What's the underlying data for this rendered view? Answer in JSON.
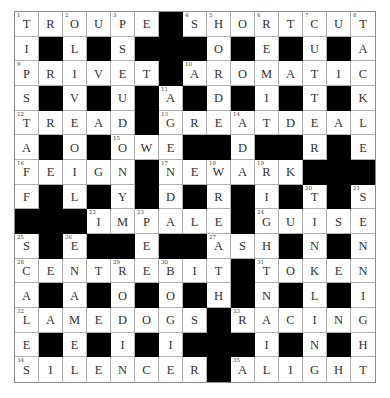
{
  "puzzle": {
    "type": "crossword",
    "rows": 15,
    "cols": 15,
    "colors": {
      "black_square": "#000000",
      "white_square": "#ffffff",
      "grid_line": "#b0b0b0",
      "letter": "#333333"
    },
    "grid": [
      "TROUPE#SHORTCUT",
      "I#L#S###O#E#U#A",
      "PRIVET#AROMATIC",
      "S#V#U#A#D#I#T#K",
      "TREAD#GREATDEAL",
      "A#O#OWE##D##R#E",
      "FEIGN#NEWARK###",
      "F#L#Y#D#R#I#T#S",
      "###IMPALE#GUISE",
      "S#E##E##ASH#N#N",
      "CENTREBIT#TOKEN",
      "A#A#O#O#H#N#L#I",
      "LAMEDOGS#RACING",
      "E#E#I#I###I#N#H",
      "SILENCER#ALIGHT"
    ],
    "numbers": [
      {
        "n": "1",
        "r": 0,
        "c": 0
      },
      {
        "n": "2",
        "r": 0,
        "c": 2
      },
      {
        "n": "3",
        "r": 0,
        "c": 4
      },
      {
        "n": "4",
        "r": 0,
        "c": 7
      },
      {
        "n": "5",
        "r": 0,
        "c": 8
      },
      {
        "n": "6",
        "r": 0,
        "c": 10
      },
      {
        "n": "7",
        "r": 0,
        "c": 12
      },
      {
        "n": "8",
        "r": 0,
        "c": 14
      },
      {
        "n": "9",
        "r": 2,
        "c": 0
      },
      {
        "n": "10",
        "r": 2,
        "c": 7
      },
      {
        "n": "11",
        "r": 3,
        "c": 6
      },
      {
        "n": "12",
        "r": 4,
        "c": 0
      },
      {
        "n": "13",
        "r": 4,
        "c": 6
      },
      {
        "n": "14",
        "r": 4,
        "c": 9
      },
      {
        "n": "15",
        "r": 5,
        "c": 4
      },
      {
        "n": "16",
        "r": 6,
        "c": 0
      },
      {
        "n": "17",
        "r": 6,
        "c": 6
      },
      {
        "n": "18",
        "r": 6,
        "c": 8
      },
      {
        "n": "19",
        "r": 6,
        "c": 10
      },
      {
        "n": "20",
        "r": 7,
        "c": 12
      },
      {
        "n": "21",
        "r": 7,
        "c": 14
      },
      {
        "n": "22",
        "r": 8,
        "c": 3
      },
      {
        "n": "23",
        "r": 8,
        "c": 5
      },
      {
        "n": "24",
        "r": 8,
        "c": 10
      },
      {
        "n": "25",
        "r": 9,
        "c": 0
      },
      {
        "n": "26",
        "r": 9,
        "c": 2
      },
      {
        "n": "27",
        "r": 9,
        "c": 8
      },
      {
        "n": "28",
        "r": 10,
        "c": 0
      },
      {
        "n": "29",
        "r": 10,
        "c": 4
      },
      {
        "n": "30",
        "r": 10,
        "c": 6
      },
      {
        "n": "31",
        "r": 10,
        "c": 10
      },
      {
        "n": "32",
        "r": 12,
        "c": 0
      },
      {
        "n": "33",
        "r": 12,
        "c": 9
      },
      {
        "n": "34",
        "r": 14,
        "c": 0
      },
      {
        "n": "35",
        "r": 14,
        "c": 9
      }
    ],
    "answers": {
      "across": [
        {
          "n": "1",
          "answer": "TROUPE"
        },
        {
          "n": "4",
          "answer": "SHORTCUT"
        },
        {
          "n": "9",
          "answer": "PRIVET"
        },
        {
          "n": "10",
          "answer": "AROMATIC"
        },
        {
          "n": "12",
          "answer": "TREAD"
        },
        {
          "n": "13",
          "answer": "GREATDEAL"
        },
        {
          "n": "15",
          "answer": "OWE"
        },
        {
          "n": "16",
          "answer": "FEIGN"
        },
        {
          "n": "17",
          "answer": "NEWARK"
        },
        {
          "n": "22",
          "answer": "IMPALE"
        },
        {
          "n": "24",
          "answer": "GUISE"
        },
        {
          "n": "27",
          "answer": "ASH"
        },
        {
          "n": "28",
          "answer": "CENTREBIT"
        },
        {
          "n": "31",
          "answer": "TOKEN"
        },
        {
          "n": "32",
          "answer": "LAMEDOGS"
        },
        {
          "n": "33",
          "answer": "RACING"
        },
        {
          "n": "34",
          "answer": "SILENCER"
        },
        {
          "n": "35",
          "answer": "ALIGHT"
        }
      ]
    }
  }
}
